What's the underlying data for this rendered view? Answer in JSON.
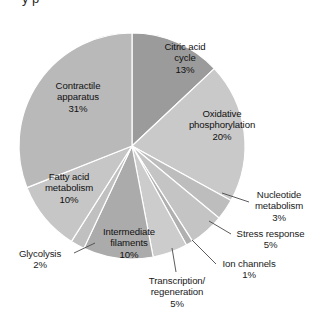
{
  "chart_data": {
    "type": "pie",
    "title": "",
    "xlabel": "",
    "ylabel": "",
    "units": "percent",
    "total": 100,
    "legend_position": "none",
    "grid": false,
    "start_angle_deg": 0,
    "direction": "clockwise",
    "categories": [
      "Citric acid cycle",
      "Oxidative phosphorylation",
      "Nucleotide metabolism",
      "Stress response",
      "Ion channels",
      "Transcription/ regeneration",
      "Intermediate filaments",
      "Glycolysis",
      "Fatty acid metabolism",
      "Contractile apparatus"
    ],
    "values": [
      13,
      20,
      3,
      5,
      1,
      5,
      10,
      2,
      10,
      31
    ],
    "slices": [
      {
        "label_line1": "Citric acid",
        "label_line2": "cycle",
        "value_label": "13%",
        "value": 13,
        "color": "#9b9b9b",
        "placement": "inside",
        "label_x": 152,
        "label_y": 41,
        "label_w": 66
      },
      {
        "label_line1": "Oxidative",
        "label_line2": "phosphorylation",
        "value_label": "20%",
        "value": 20,
        "color": "#c9c9c9",
        "placement": "inside",
        "label_x": 178,
        "label_y": 108,
        "label_w": 88
      },
      {
        "label_line1": "Nucleotide",
        "label_line2": "metabolism",
        "value_label": "3%",
        "value": 3,
        "color": "#bdbdbd",
        "placement": "outside",
        "label_x": 245,
        "label_y": 189,
        "label_w": 68,
        "leader": [
          249,
          202,
          222,
          193
        ]
      },
      {
        "label_line1": "Stress response",
        "label_line2": "",
        "value_label": "5%",
        "value": 5,
        "color": "#c4c4c4",
        "placement": "outside",
        "label_x": 228,
        "label_y": 228,
        "label_w": 85,
        "leader": [
          231,
          234,
          209,
          221
        ]
      },
      {
        "label_line1": "Ion channels",
        "label_line2": "",
        "value_label": "1%",
        "value": 1,
        "color": "#b0b0b0",
        "placement": "outside",
        "label_x": 213,
        "label_y": 258,
        "label_w": 72,
        "leader": [
          216,
          264,
          192,
          240
        ]
      },
      {
        "label_line1": "Transcription/",
        "label_line2": "regeneration",
        "value_label": "5%",
        "value": 5,
        "color": "#cccccc",
        "placement": "outside",
        "label_x": 140,
        "label_y": 275,
        "label_w": 74,
        "leader": [
          176,
          272,
          172,
          248
        ]
      },
      {
        "label_line1": "Intermediate",
        "label_line2": "filaments",
        "value_label": "10%",
        "value": 10,
        "color": "#ababab",
        "placement": "inside",
        "label_x": 92,
        "label_y": 226,
        "label_w": 74
      },
      {
        "label_line1": "Glycolysis",
        "label_line2": "",
        "value_label": "2%",
        "value": 2,
        "color": "#c0c0c0",
        "placement": "outside",
        "label_x": 8,
        "label_y": 248,
        "label_w": 64,
        "leader": [
          74,
          253,
          95,
          243
        ]
      },
      {
        "label_line1": "Fatty acid",
        "label_line2": "metabolism",
        "value_label": "10%",
        "value": 10,
        "color": "#c6c6c6",
        "placement": "inside",
        "label_x": 32,
        "label_y": 171,
        "label_w": 74
      },
      {
        "label_line1": "Contractile",
        "label_line2": "apparatus",
        "value_label": "31%",
        "value": 31,
        "color": "#b9b9b9",
        "placement": "inside",
        "label_x": 38,
        "label_y": 80,
        "label_w": 80
      }
    ],
    "geometry": {
      "cx": 132,
      "cy": 146,
      "r": 113
    },
    "style": {
      "slice_stroke": "#ffffff",
      "leader_color": "#4a4a4a",
      "text_color": "#1a1a1a"
    }
  }
}
